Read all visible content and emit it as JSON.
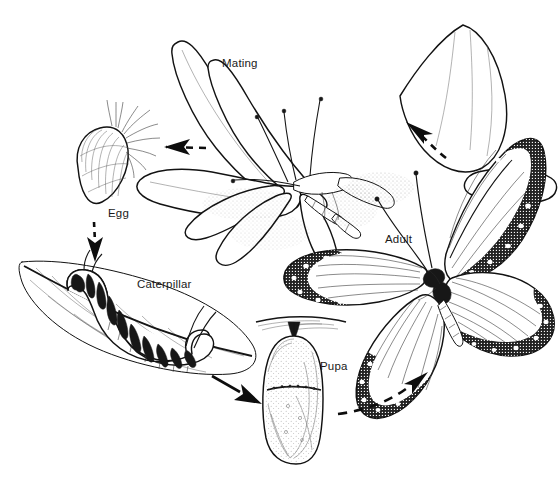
{
  "diagram": {
    "background_color": "#ffffff",
    "ink_color": "#151515",
    "width": 559,
    "height": 487,
    "style": "black-and-white pen-and-ink scientific illustration"
  },
  "stages": [
    {
      "id": "mating",
      "label": "Mating",
      "label_x": 222,
      "label_y": 67,
      "description": "Two adult monarch butterflies joined end-to-end with wings spread"
    },
    {
      "id": "egg",
      "label": "Egg",
      "label_x": 108,
      "label_y": 217,
      "description": "Ribbed ovoid monarch egg attached to fine plant hairs"
    },
    {
      "id": "caterpillar",
      "label": "Caterpillar",
      "label_x": 137,
      "label_y": 288,
      "description": "Banded monarch larva feeding on a milkweed leaf"
    },
    {
      "id": "pupa",
      "label": "Pupa",
      "label_x": 320,
      "label_y": 370,
      "description": "Chrysalis hanging from a silk pad"
    },
    {
      "id": "adult",
      "label": "Adult",
      "label_x": 385,
      "label_y": 243,
      "description": "Adult monarch butterfly with open wings"
    }
  ],
  "arrows": [
    {
      "id": "mating-to-egg",
      "from": "mating",
      "to": "egg",
      "style": "dashed",
      "direction": "left"
    },
    {
      "id": "egg-to-caterpillar",
      "from": "egg",
      "to": "caterpillar",
      "style": "dashed",
      "direction": "down"
    },
    {
      "id": "caterpillar-to-pupa",
      "from": "caterpillar",
      "to": "pupa",
      "style": "solid",
      "direction": "down-right"
    },
    {
      "id": "pupa-to-adult",
      "from": "pupa",
      "to": "adult",
      "style": "dashed",
      "direction": "up-right"
    },
    {
      "id": "adult-to-mating",
      "from": "adult",
      "to": "mating",
      "style": "dashed",
      "direction": "up-left"
    }
  ]
}
